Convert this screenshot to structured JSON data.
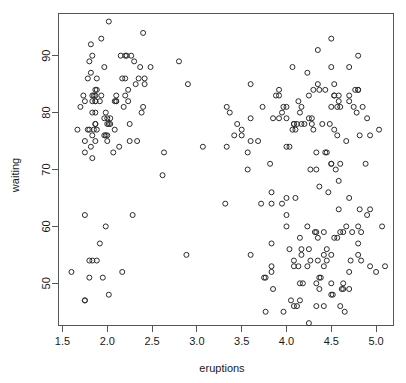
{
  "chart_data": {
    "type": "scatter",
    "title": "",
    "subtitle": "",
    "xlabel": "eruptions",
    "ylabel": "waiting",
    "xlim": [
      1.45,
      5.2
    ],
    "ylim": [
      42.5,
      97.5
    ],
    "xticks": [
      1.5,
      2.0,
      2.5,
      3.0,
      3.5,
      4.0,
      4.5,
      5.0
    ],
    "xticklabels": [
      "1.5",
      "2.0",
      "2.5",
      "3.0",
      "3.5",
      "4.0",
      "4.5",
      "5.0"
    ],
    "yticks": [
      50,
      60,
      70,
      80,
      90
    ],
    "yticklabels": [
      "50",
      "60",
      "70",
      "80",
      "90"
    ],
    "grid": false,
    "legend": null,
    "marker": "open-circle",
    "marker_color": "#2b2b2b",
    "marker_size_px": 5,
    "frame_color": "#555555",
    "background_color": "#ffffff",
    "n_points": 272,
    "x": [
      3.6,
      1.8,
      3.333,
      2.283,
      4.533,
      2.883,
      4.7,
      3.6,
      1.95,
      4.35,
      1.833,
      3.917,
      4.2,
      1.75,
      4.7,
      2.167,
      1.75,
      4.8,
      1.6,
      4.25,
      1.8,
      1.75,
      3.45,
      3.067,
      4.533,
      3.6,
      1.967,
      4.083,
      3.85,
      4.433,
      4.3,
      4.467,
      3.367,
      4.033,
      3.833,
      2.017,
      1.867,
      4.833,
      1.833,
      4.783,
      4.35,
      1.883,
      4.567,
      1.75,
      4.533,
      3.317,
      3.833,
      2.1,
      4.633,
      2.0,
      4.8,
      4.716,
      1.833,
      4.833,
      1.733,
      4.883,
      3.717,
      1.667,
      4.567,
      4.317,
      2.233,
      4.5,
      1.75,
      4.8,
      1.817,
      4.4,
      4.167,
      4.7,
      2.067,
      4.7,
      4.033,
      1.967,
      4.5,
      4.0,
      1.983,
      5.067,
      2.017,
      4.567,
      3.883,
      3.6,
      4.133,
      4.333,
      4.1,
      2.633,
      4.067,
      4.933,
      3.95,
      4.517,
      2.167,
      4.0,
      2.2,
      4.333,
      1.867,
      4.817,
      1.833,
      4.3,
      4.667,
      3.75,
      1.867,
      4.9,
      2.483,
      4.367,
      2.1,
      4.5,
      4.05,
      1.867,
      4.7,
      1.783,
      4.85,
      3.683,
      4.733,
      2.3,
      4.9,
      4.417,
      1.7,
      4.633,
      2.317,
      4.6,
      1.817,
      4.417,
      2.617,
      4.067,
      4.25,
      1.967,
      4.6,
      3.767,
      1.917,
      4.5,
      2.267,
      4.65,
      1.867,
      4.167,
      2.8,
      4.333,
      1.833,
      4.383,
      1.883,
      4.933,
      2.033,
      3.733,
      4.233,
      2.233,
      4.533,
      4.817,
      4.333,
      1.983,
      4.633,
      2.017,
      5.1,
      1.8,
      5.033,
      4.0,
      2.4,
      4.6,
      3.567,
      4.0,
      4.5,
      4.083,
      1.8,
      3.967,
      2.2,
      4.15,
      2.0,
      3.833,
      3.5,
      4.583,
      2.367,
      5.0,
      1.933,
      4.617,
      1.917,
      2.083,
      4.583,
      3.333,
      4.167,
      4.333,
      4.5,
      2.417,
      4.0,
      4.167,
      1.883,
      4.583,
      4.25,
      3.767,
      2.033,
      4.433,
      4.083,
      1.833,
      4.417,
      2.183,
      4.8,
      1.833,
      4.8,
      4.1,
      3.966,
      4.233,
      3.5,
      4.366,
      2.25,
      4.667,
      2.1,
      4.35,
      4.133,
      1.867,
      4.6,
      1.783,
      4.367,
      3.85,
      1.933,
      4.5,
      2.383,
      4.7,
      1.867,
      3.833,
      3.417,
      4.233,
      2.4,
      4.8,
      2.0,
      4.15,
      1.867,
      4.267,
      1.75,
      4.483,
      4.0,
      4.117,
      4.083,
      4.267,
      3.917,
      4.55,
      4.083,
      2.417,
      4.183,
      2.217,
      4.45,
      1.883,
      1.85,
      4.283,
      3.95,
      2.333,
      4.15,
      2.35,
      4.933,
      2.9,
      4.583,
      3.833,
      2.083,
      4.367,
      2.133,
      4.35,
      2.2,
      4.45,
      3.567,
      4.5,
      4.15,
      3.817,
      3.917,
      4.45,
      2.0,
      4.283,
      4.767,
      4.533,
      1.85,
      4.25,
      1.983,
      2.25,
      4.75,
      4.117,
      2.15,
      4.417,
      1.817,
      4.467
    ],
    "y": [
      79,
      54,
      74,
      62,
      85,
      55,
      88,
      85,
      51,
      85,
      54,
      84,
      78,
      47,
      83,
      52,
      62,
      84,
      52,
      79,
      51,
      47,
      78,
      74,
      83,
      55,
      76,
      78,
      79,
      73,
      77,
      66,
      80,
      74,
      52,
      48,
      80,
      59,
      90,
      80,
      58,
      84,
      58,
      73,
      83,
      64,
      53,
      82,
      59,
      75,
      90,
      54,
      80,
      54,
      83,
      71,
      64,
      77,
      81,
      59,
      84,
      48,
      82,
      60,
      92,
      78,
      78,
      65,
      73,
      82,
      56,
      79,
      71,
      62,
      76,
      60,
      78,
      76,
      83,
      75,
      82,
      70,
      65,
      73,
      88,
      76,
      80,
      48,
      86,
      60,
      90,
      50,
      78,
      63,
      72,
      84,
      75,
      51,
      82,
      62,
      88,
      49,
      83,
      81,
      47,
      84,
      52,
      86,
      81,
      75,
      59,
      89,
      79,
      59,
      81,
      50,
      85,
      59,
      87,
      53,
      69,
      77,
      56,
      88,
      81,
      45,
      82,
      55,
      90,
      45,
      83,
      56,
      89,
      46,
      82,
      51,
      86,
      53,
      79,
      81,
      60,
      82,
      77,
      76,
      59,
      80,
      49,
      96,
      53,
      77,
      77,
      65,
      81,
      71,
      70,
      81,
      93,
      53,
      89,
      45,
      86,
      58,
      78,
      66,
      76,
      63,
      88,
      52,
      93,
      49,
      57,
      77,
      68,
      81,
      81,
      73,
      50,
      85,
      74,
      55,
      77,
      83,
      83,
      51,
      78,
      84,
      46,
      83,
      55,
      81,
      57,
      76,
      84,
      77,
      81,
      87,
      77,
      51,
      78,
      60,
      82,
      91,
      53,
      78,
      46,
      77,
      84,
      49,
      83,
      71,
      80,
      49,
      75,
      64,
      76,
      53,
      94,
      55,
      76,
      50,
      82,
      54,
      75,
      78,
      79,
      78,
      78,
      70,
      79,
      70,
      54,
      86,
      50,
      90,
      54,
      54,
      77,
      79,
      64,
      75,
      47,
      86,
      63,
      85,
      82,
      57,
      82,
      67,
      74,
      54,
      83,
      73,
      73,
      88,
      80,
      71,
      83,
      56,
      79,
      78,
      84,
      58,
      83,
      43,
      60,
      75,
      81,
      46,
      90,
      46,
      74
    ],
    "points_summary": {
      "cluster_short": {
        "x_range": [
          1.6,
          2.9
        ],
        "y_range": [
          43,
          71
        ],
        "approx_count": 97
      },
      "cluster_long": {
        "x_range": [
          3.3,
          5.1
        ],
        "y_range": [
          64,
          96
        ],
        "approx_count": 175
      }
    }
  },
  "figure": {
    "device": "r-graphics-device",
    "plot_region": {
      "left_px": 58,
      "top_px": 13,
      "right_px": 394,
      "bottom_px": 326
    }
  }
}
